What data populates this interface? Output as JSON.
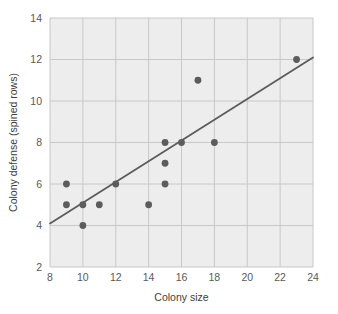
{
  "chart_data": {
    "type": "scatter",
    "title": "",
    "xlabel": "Colony size",
    "ylabel": "Colony defense (spined rows)",
    "xlim": [
      8,
      24
    ],
    "ylim": [
      2,
      14
    ],
    "xticks": [
      8,
      10,
      12,
      14,
      16,
      18,
      20,
      22,
      24
    ],
    "yticks": [
      2,
      4,
      6,
      8,
      10,
      12,
      14
    ],
    "xtick_labels": [
      "8",
      "10",
      "12",
      "14",
      "16",
      "18",
      "20",
      "22",
      "24"
    ],
    "ytick_labels": [
      "2",
      "4",
      "6",
      "8",
      "10",
      "12",
      "14"
    ],
    "grid": true,
    "legend": "none",
    "points": [
      {
        "x": 9,
        "y": 6
      },
      {
        "x": 9,
        "y": 5
      },
      {
        "x": 10,
        "y": 5
      },
      {
        "x": 10,
        "y": 4
      },
      {
        "x": 11,
        "y": 5
      },
      {
        "x": 12,
        "y": 6
      },
      {
        "x": 14,
        "y": 5
      },
      {
        "x": 15,
        "y": 8
      },
      {
        "x": 15,
        "y": 7
      },
      {
        "x": 15,
        "y": 6
      },
      {
        "x": 16,
        "y": 8
      },
      {
        "x": 17,
        "y": 11
      },
      {
        "x": 18,
        "y": 8
      },
      {
        "x": 23,
        "y": 12
      }
    ],
    "trendline": {
      "x1": 8,
      "y1": 4.1,
      "x2": 24,
      "y2": 12.1
    },
    "colors": {
      "plot_background": "#ededed",
      "gridline": "#c8c8c8",
      "point": "#5c5c5c",
      "trendline": "#5c5c5c",
      "tick_text": "#58595b",
      "axis_title_text": "#3d3d3d",
      "page_background": "#ffffff"
    },
    "geometry": {
      "plot_left": 50,
      "plot_top": 18,
      "plot_right": 313,
      "plot_bottom": 267,
      "point_radius": 3.4,
      "trendline_width": 1.8,
      "gridline_width": 1
    }
  }
}
